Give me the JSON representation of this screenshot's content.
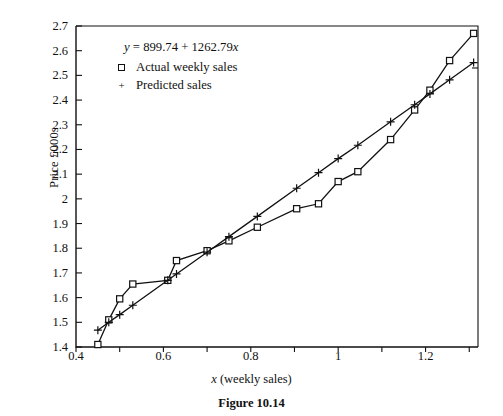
{
  "caption": "Figure 10.14",
  "axes": {
    "xlabel_prefix": "x",
    "xlabel_rest": " (weekly sales)",
    "ylabel": "Price £000s",
    "xticks": [
      "0.4",
      "0.6",
      "0.8",
      "1",
      "1.2"
    ],
    "xminor": [
      0.5,
      0.7,
      0.9,
      1.1,
      1.3
    ],
    "yticks": [
      "2.7",
      "2.6",
      "2.5",
      "2.4",
      "2.3",
      "2.2",
      "2.1",
      "2",
      "1.9",
      "1.8",
      "1.7",
      "1.6",
      "1.5",
      "1.4"
    ]
  },
  "legend": {
    "equation_prefix": "y",
    "equation_rest": " = 899.74 + 1262.79",
    "equation_var": "x",
    "actual_label": "Actual weekly sales",
    "predicted_label": "Predicted sales",
    "actual_marker": "square-marker",
    "predicted_marker": "plus-marker"
  },
  "colors": {
    "ink": "#111111",
    "background": "#ffffff"
  },
  "chart_data": {
    "type": "line",
    "title": "",
    "subtitle": "",
    "xlabel": "x (weekly sales)",
    "ylabel": "Price £000s",
    "xlim": [
      0.4,
      1.32
    ],
    "ylim": [
      1.4,
      2.7
    ],
    "grid": false,
    "legend_position": "upper-left-inside",
    "annotations": [
      "y = 899.74 + 1262.79x"
    ],
    "regression": {
      "intercept": 899.74,
      "slope": 1262.79,
      "units": "pounds",
      "scale_divisor": 1000
    },
    "series": [
      {
        "name": "Actual weekly sales",
        "marker": "open-square",
        "x": [
          0.45,
          0.475,
          0.5,
          0.53,
          0.61,
          0.63,
          0.7,
          0.75,
          0.815,
          0.905,
          0.955,
          1.0,
          1.045,
          1.12,
          1.175,
          1.21,
          1.255,
          1.31
        ],
        "values": [
          1.41,
          1.51,
          1.595,
          1.655,
          1.67,
          1.75,
          1.79,
          1.83,
          1.885,
          1.96,
          1.98,
          2.07,
          2.11,
          2.24,
          2.36,
          2.44,
          2.56,
          2.67
        ]
      },
      {
        "name": "Predicted sales",
        "marker": "plus",
        "x": [
          0.45,
          0.475,
          0.5,
          0.53,
          0.61,
          0.63,
          0.7,
          0.75,
          0.815,
          0.905,
          0.955,
          1.0,
          1.045,
          1.12,
          1.175,
          1.21,
          1.255,
          1.31
        ],
        "values": [
          1.468,
          1.5,
          1.531,
          1.569,
          1.67,
          1.696,
          1.784,
          1.847,
          1.929,
          2.043,
          2.106,
          2.163,
          2.217,
          2.312,
          2.381,
          2.425,
          2.482,
          2.552
        ]
      }
    ]
  }
}
